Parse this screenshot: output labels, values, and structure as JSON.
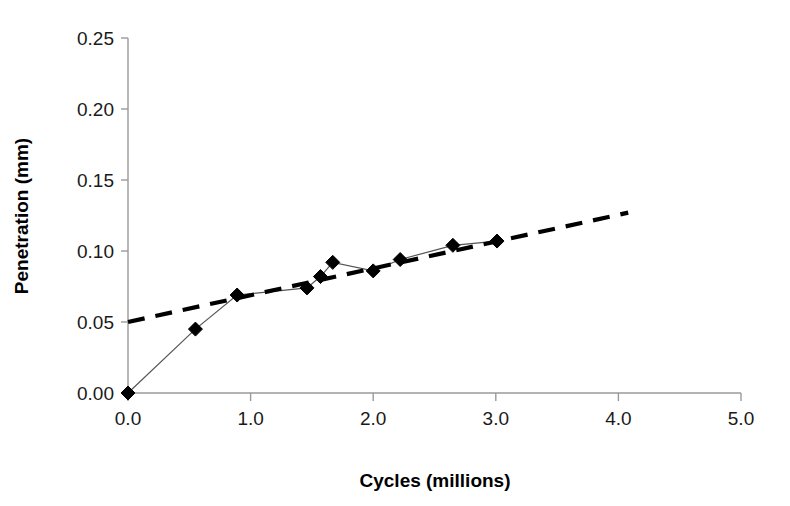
{
  "chart_data": {
    "type": "line",
    "title": "",
    "xlabel": "Cycles (millions)",
    "ylabel": "Penetration (mm)",
    "xlim": [
      0.0,
      5.0
    ],
    "ylim": [
      0.0,
      0.25
    ],
    "xticks": [
      "0.0",
      "1.0",
      "2.0",
      "3.0",
      "4.0",
      "5.0"
    ],
    "xtick_values": [
      0.0,
      1.0,
      2.0,
      3.0,
      4.0,
      5.0
    ],
    "yticks": [
      "0.00",
      "0.05",
      "0.10",
      "0.15",
      "0.20",
      "0.25"
    ],
    "ytick_values": [
      0.0,
      0.05,
      0.1,
      0.15,
      0.2,
      0.25
    ],
    "grid": false,
    "legend": "none",
    "marker": "diamond",
    "series": [
      {
        "name": "Penetration measurements",
        "style": "solid-with-diamond-markers",
        "color": "#000000",
        "x": [
          0.0,
          0.55,
          0.89,
          1.46,
          1.57,
          1.67,
          2.0,
          2.22,
          2.65,
          3.01
        ],
        "y": [
          0.0,
          0.045,
          0.069,
          0.074,
          0.082,
          0.092,
          0.086,
          0.094,
          0.104,
          0.107
        ]
      },
      {
        "name": "Trend line",
        "style": "dashed",
        "color": "#000000",
        "x": [
          0.0,
          4.08
        ],
        "y": [
          0.05,
          0.127
        ]
      }
    ]
  },
  "geometry": {
    "plot_left": 128,
    "plot_right": 741,
    "plot_top": 38,
    "plot_bottom": 393
  }
}
